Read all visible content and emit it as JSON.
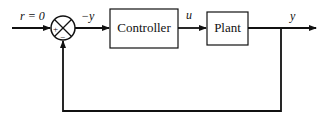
{
  "diagram": {
    "type": "feedback-control-block-diagram",
    "signals": {
      "reference": "r = 0",
      "error": "−y",
      "control": "u",
      "output": "y"
    },
    "blocks": [
      {
        "id": "controller",
        "label": "Controller"
      },
      {
        "id": "plant",
        "label": "Plant"
      }
    ],
    "summing_junction": {
      "plus_sign": "+",
      "minus_sign": "−"
    },
    "colors": {
      "stroke": "#111111",
      "background": "#ffffff"
    }
  }
}
